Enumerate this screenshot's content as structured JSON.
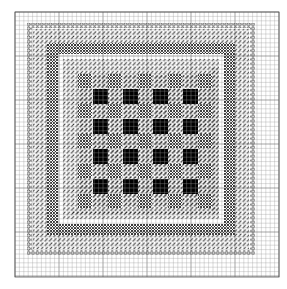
{
  "pattern": {
    "title": "Needlepoint chart: checkerboard center with concentric stitch borders",
    "canvas": {
      "width": 287,
      "height": 289
    },
    "grid": {
      "x0": 15,
      "y0": 12,
      "x1": 279,
      "y1": 277,
      "cell": 4.4,
      "line_color": "#9a9a9a",
      "major_every": 10,
      "major_color": "#6a6a6a"
    },
    "colors": {
      "background": "#ffffff",
      "ink": "#111111",
      "fill_black": "#000000",
      "hatch": "#333333"
    },
    "rings": [
      {
        "name": "circle-stitch-border",
        "type": "circles",
        "outer": [
          27,
          23,
          255,
          255
        ],
        "width": 5
      },
      {
        "name": "diagonal-stitch-border",
        "type": "diagonal",
        "outer": [
          33,
          29,
          249,
          249
        ],
        "width": 14
      },
      {
        "name": "crosshatch-border",
        "type": "crosshatch",
        "outer": [
          47,
          43,
          235,
          235
        ],
        "width": 11
      },
      {
        "name": "plain-gap",
        "type": "plain",
        "outer": [
          58,
          54,
          224,
          224
        ],
        "width": 5
      },
      {
        "name": "inner-diagonal-border",
        "type": "diagonal",
        "outer": [
          63,
          59,
          219,
          219
        ],
        "width": 9
      }
    ],
    "center": {
      "x0": 72,
      "y0": 68,
      "size": 146,
      "pitch": 30,
      "black_size": 15,
      "black_offset": 21,
      "cross_offset": 6,
      "cross_size": 14,
      "rows": 4,
      "cols": 4
    }
  }
}
